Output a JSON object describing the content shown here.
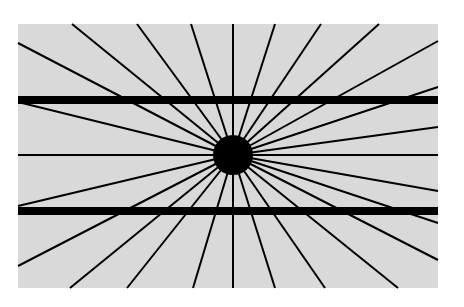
{
  "figure": {
    "canvas": {
      "width": 464,
      "height": 307,
      "background": "#ffffff"
    },
    "panel": {
      "x": 18,
      "y": 24,
      "width": 420,
      "height": 264,
      "fill": "#d9d9d9"
    },
    "center": {
      "x": 233,
      "y": 155
    },
    "disc": {
      "radius": 20,
      "fill": "#000000"
    },
    "ray_color": "#000000",
    "ray_width": 2,
    "ray_endpoints": [
      [
        18,
        43
      ],
      [
        72,
        24
      ],
      [
        137,
        24
      ],
      [
        191,
        24
      ],
      [
        233,
        24
      ],
      [
        275,
        24
      ],
      [
        321,
        24
      ],
      [
        379,
        24
      ],
      [
        438,
        41
      ],
      [
        438,
        87
      ],
      [
        438,
        127
      ],
      [
        438,
        155
      ],
      [
        438,
        191
      ],
      [
        438,
        223
      ],
      [
        438,
        260
      ],
      [
        398,
        288
      ],
      [
        325,
        288
      ],
      [
        275,
        288
      ],
      [
        233,
        288
      ],
      [
        193,
        288
      ],
      [
        127,
        288
      ],
      [
        70,
        288
      ],
      [
        18,
        266
      ],
      [
        18,
        206
      ],
      [
        18,
        155
      ],
      [
        18,
        102
      ]
    ],
    "bars": [
      {
        "name": "upper-bar",
        "y": 100,
        "thickness": 8,
        "x1": 18,
        "x2": 438
      },
      {
        "name": "lower-bar",
        "y": 211,
        "thickness": 8,
        "x1": 18,
        "x2": 438
      }
    ],
    "bar_color": "#000000"
  }
}
